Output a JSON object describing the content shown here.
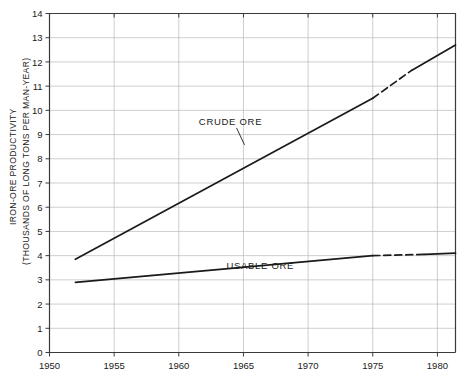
{
  "chart_data": {
    "type": "line",
    "title": "",
    "subtitle": "",
    "xlabel": "",
    "ylabel": "IRON-ORE PRODUCTIVITY (THOUSANDS OF LONG TONS PER MAN-YEAR)",
    "ylabel_line1": "IRON-ORE PRODUCTIVITY",
    "ylabel_line2": "(THOUSANDS OF LONG TONS PER MAN-YEAR)",
    "xlim": [
      1950,
      1981.4
    ],
    "ylim": [
      0,
      14
    ],
    "xticks": [
      1950,
      1955,
      1960,
      1965,
      1970,
      1975,
      1980
    ],
    "xticklabels": [
      "1950",
      "1955",
      "1960",
      "1965",
      "1970",
      "1975",
      "1980"
    ],
    "yticks": [
      0,
      1,
      2,
      3,
      4,
      5,
      6,
      7,
      8,
      9,
      10,
      11,
      12,
      13,
      14
    ],
    "yticklabels": [
      "0",
      "1",
      "2",
      "3",
      "4",
      "5",
      "6",
      "7",
      "8",
      "9",
      "10",
      "11",
      "12",
      "13",
      "14"
    ],
    "grid": true,
    "grid_color": "#b9b9b9",
    "line_color": "#1a1a1a",
    "legend_position": "inline-annotation",
    "series": [
      {
        "name": "CRUDE ORE",
        "label": "CRUDE ORE",
        "style": "solid-with-dashed-estimate",
        "x": [
          1952,
          1953,
          1954,
          1955,
          1956,
          1957,
          1958,
          1959,
          1960,
          1961,
          1962,
          1963,
          1964,
          1965,
          1966,
          1967,
          1968,
          1969,
          1970,
          1971,
          1972,
          1973,
          1974,
          1975,
          1976,
          1977,
          1978,
          1979,
          1980,
          1981.4
        ],
        "y": [
          3.85,
          4.6,
          3.5,
          4.95,
          4.7,
          5.0,
          4.35,
          3.45,
          5.65,
          4.6,
          5.1,
          6.5,
          7.5,
          8.4,
          8.45,
          9.0,
          9.8,
          10.9,
          12.2,
          12.1,
          12.8,
          11.5,
          11.2,
          10.5,
          10.95,
          11.3,
          11.65,
          12.05,
          11.35,
          12.7
        ],
        "dashed_from": 1975,
        "dashed_to": 1978
      },
      {
        "name": "USABLE ORE",
        "label": "USABLE ORE",
        "style": "solid-with-dashed-estimate",
        "x": [
          1952,
          1953,
          1954,
          1955,
          1956,
          1957,
          1958,
          1959,
          1960,
          1961,
          1962,
          1963,
          1964,
          1965,
          1966,
          1967,
          1968,
          1969,
          1970,
          1971,
          1972,
          1973,
          1974,
          1975,
          1976,
          1977,
          1978,
          1979,
          1980,
          1981.4
        ],
        "y": [
          2.9,
          3.5,
          2.6,
          3.5,
          3.05,
          3.3,
          2.85,
          2.25,
          3.1,
          3.1,
          3.2,
          3.35,
          3.85,
          4.35,
          4.35,
          4.55,
          4.8,
          5.15,
          5.05,
          5.2,
          4.75,
          4.35,
          4.15,
          4.0,
          4.0,
          4.05,
          4.1,
          4.05,
          3.85,
          4.1
        ],
        "dashed_from": 1975,
        "dashed_to": 1979
      }
    ],
    "annotations": [
      {
        "text": "CRUDE ORE",
        "x": 1964.0,
        "y": 9.4,
        "leader": true
      },
      {
        "text": "USABLE ORE",
        "x": 1966.3,
        "y": 3.45,
        "leader": false
      }
    ]
  }
}
